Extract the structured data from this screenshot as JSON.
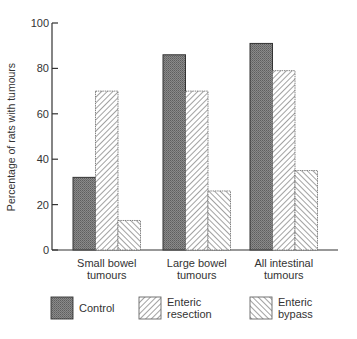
{
  "chart_data": {
    "type": "bar",
    "title": "",
    "xlabel": "",
    "ylabel": "Percentage of rats with tumours",
    "ylim": [
      0,
      100
    ],
    "yticks": [
      0,
      20,
      40,
      60,
      80,
      100
    ],
    "grid": false,
    "legend_position": "bottom",
    "categories": [
      [
        "Small bowel",
        "tumours"
      ],
      [
        "Large bowel",
        "tumours"
      ],
      [
        "All intestinal",
        "tumours"
      ]
    ],
    "series": [
      {
        "name": "Control",
        "legend_lines": [
          "Control"
        ],
        "pattern": "dense-gray",
        "values": [
          32,
          86,
          91
        ]
      },
      {
        "name": "Enteric resection",
        "legend_lines": [
          "Enteric",
          "resection"
        ],
        "pattern": "hatch-backslash",
        "values": [
          70,
          70,
          79
        ]
      },
      {
        "name": "Enteric bypass",
        "legend_lines": [
          "Enteric",
          "bypass"
        ],
        "pattern": "hatch-slash",
        "values": [
          13,
          26,
          35
        ]
      }
    ],
    "colors": {
      "control_fill": "#7a7a7a",
      "hatch_stroke": "#555555",
      "axis": "#333333"
    }
  }
}
